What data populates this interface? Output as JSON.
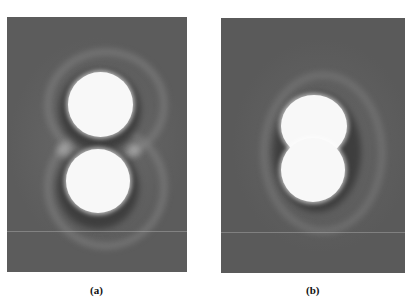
{
  "figure": {
    "panels": [
      {
        "id": "a",
        "label": "(a)",
        "description": "Two separated bright circular spots stacked vertically, each with dark halo, surrounded by a faint outer ring forming a figure-eight shape"
      },
      {
        "id": "b",
        "label": "(b)",
        "description": "Two overlapping bright spots merged into a peanut-shaped blob with dark halo and faint outer ring"
      }
    ],
    "colors": {
      "background": "#5c5c5c",
      "spot": "#f8f8f8",
      "halo": "#3e3e3e"
    }
  }
}
